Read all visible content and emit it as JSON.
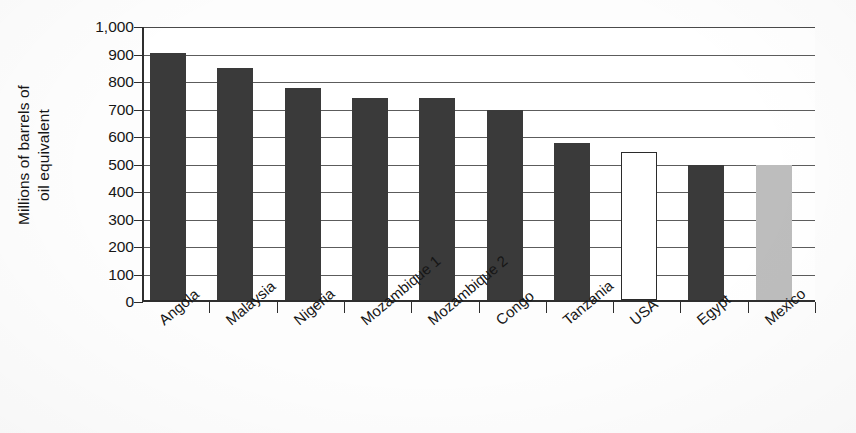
{
  "chart_data": {
    "type": "bar",
    "title": "",
    "xlabel": "",
    "ylabel": "Millions of barrels of oil equivalent",
    "ylabel_line1": "Millions of barrels of",
    "ylabel_line2": "oil equivalent",
    "categories": [
      "Angola",
      "Malaysia",
      "Nigeria",
      "Mozambique 1",
      "Mozambique 2",
      "Congo",
      "Tanzania",
      "USA",
      "Egypt",
      "Mexico"
    ],
    "values": [
      900,
      845,
      770,
      735,
      735,
      690,
      570,
      540,
      490,
      490
    ],
    "bar_styles": [
      "dark",
      "dark",
      "dark",
      "dark",
      "dark",
      "dark",
      "dark",
      "white",
      "dark",
      "gray"
    ],
    "ylim": [
      0,
      1000
    ],
    "ytick_values": [
      0,
      100,
      200,
      300,
      400,
      500,
      600,
      700,
      800,
      900,
      1000
    ],
    "ytick_labels": [
      "0",
      "100",
      "200",
      "300",
      "400",
      "500",
      "600",
      "700",
      "800",
      "900",
      "1,000"
    ],
    "grid": true,
    "grid_axis": "y",
    "legend": "none",
    "colors": {
      "dark": "#3a3a3a",
      "white": "#ffffff",
      "gray": "#bdbdbd",
      "axis": "#2e2e2e",
      "gridline": "#5c5c5c",
      "text": "#161616",
      "background": "#ffffff"
    }
  }
}
